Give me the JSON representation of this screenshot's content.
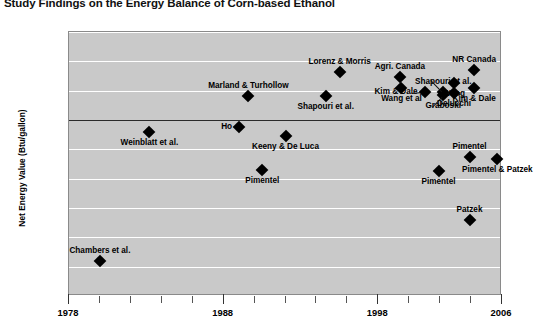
{
  "chart_data": {
    "type": "scatter",
    "title": "Study Findings on the Energy Balance of Corn-based Ethanol",
    "xlabel": "",
    "ylabel": "Net Energy Value (Btu/gallon)",
    "xlim": [
      1978,
      2006
    ],
    "ylim": [
      -120000,
      60000
    ],
    "grid": true,
    "legend": "none",
    "yticks": [
      "60,000",
      "40,000",
      "20,000",
      "0",
      "-20,000",
      "-40,000",
      "-60,000",
      "-80,000",
      "-100,000",
      "-120,000"
    ],
    "ytick_values": [
      60000,
      40000,
      20000,
      0,
      -20000,
      -40000,
      -60000,
      -80000,
      -100000,
      -120000
    ],
    "xticks": [
      "1978",
      "1988",
      "1998",
      "2006"
    ],
    "xtick_values": [
      1978,
      1988,
      1998,
      2006
    ],
    "xtick_minor_values": [
      1980,
      1982,
      1984,
      1986,
      1990,
      1992,
      1994,
      1996,
      2000,
      2002,
      2004
    ],
    "points": [
      {
        "label": "Chambers et al.",
        "x": 1980.0,
        "y": -96000,
        "label_pos": "above"
      },
      {
        "label": "Weinblatt et al.",
        "x": 1983.2,
        "y": -8500,
        "label_pos": "below"
      },
      {
        "label": "Marland & Turhollow",
        "x": 1989.6,
        "y": 16500,
        "label_pos": "above"
      },
      {
        "label": "Ho",
        "x": 1989.0,
        "y": -5000,
        "label_pos": "left"
      },
      {
        "label": "Pimentel",
        "x": 1990.5,
        "y": -34000,
        "label_pos": "below"
      },
      {
        "label": "Keeny & De Luca",
        "x": 1992.0,
        "y": -11000,
        "label_pos": "below"
      },
      {
        "label": "Shapouri et al.",
        "x": 1994.6,
        "y": 16500,
        "label_pos": "below"
      },
      {
        "label": "Lorenz & Morris",
        "x": 1995.5,
        "y": 33000,
        "label_pos": "above"
      },
      {
        "label": "Agri. Canada",
        "x": 1999.4,
        "y": 29500,
        "label_pos": "above"
      },
      {
        "label": "Wang et al",
        "x": 1999.5,
        "y": 22000,
        "label_pos": "below"
      },
      {
        "label": "Kim & Dale",
        "x": 2001.0,
        "y": 19000,
        "label_pos": "left"
      },
      {
        "label": "Shapouri et al.",
        "x": 2002.2,
        "y": 19000,
        "label_pos": "above"
      },
      {
        "label": "Graboski",
        "x": 2002.2,
        "y": 17000,
        "label_pos": "below"
      },
      {
        "label": "Wang",
        "x": 2002.9,
        "y": 25000,
        "label_pos": "below"
      },
      {
        "label": "Delucchi",
        "x": 2002.9,
        "y": 18500,
        "label_pos": "below"
      },
      {
        "label": "NR Canada",
        "x": 2004.2,
        "y": 34000,
        "label_pos": "above"
      },
      {
        "label": "Kim & Dale",
        "x": 2004.2,
        "y": 22000,
        "label_pos": "below"
      },
      {
        "label": "Pimentel",
        "x": 2001.9,
        "y": -35000,
        "label_pos": "below"
      },
      {
        "label": "Pimentel",
        "x": 2003.9,
        "y": -25000,
        "label_pos": "above"
      },
      {
        "label": "Pimentel & Patzek",
        "x": 2005.7,
        "y": -26500,
        "label_pos": "below"
      },
      {
        "label": "Patzek",
        "x": 2003.9,
        "y": -68000,
        "label_pos": "above"
      }
    ]
  }
}
